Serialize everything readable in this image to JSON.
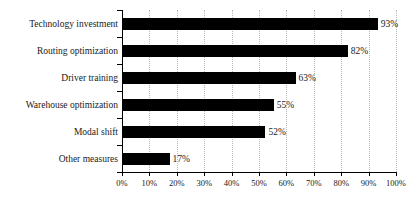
{
  "chart_data": {
    "type": "bar",
    "orientation": "horizontal",
    "title": "",
    "xlabel": "",
    "ylabel": "",
    "xlim": [
      0,
      100
    ],
    "grid": true,
    "legend": false,
    "categories": [
      "Technology investment",
      "Routing optimization",
      "Driver training",
      "Warehouse optimization",
      "Modal shift",
      "Other measures"
    ],
    "values": [
      93,
      82,
      63,
      55,
      52,
      17
    ],
    "value_labels": [
      "93%",
      "82%",
      "63%",
      "55%",
      "52%",
      "17%"
    ],
    "xticks": [
      0,
      10,
      20,
      30,
      40,
      50,
      60,
      70,
      80,
      90,
      100
    ],
    "xtick_labels": [
      "0%",
      "10%",
      "20%",
      "30%",
      "40%",
      "50%",
      "60%",
      "70%",
      "80%",
      "90%",
      "100%"
    ],
    "bar_color": "#000000",
    "gridline_color": "#b9b9b9",
    "axis_color": "#000000"
  }
}
